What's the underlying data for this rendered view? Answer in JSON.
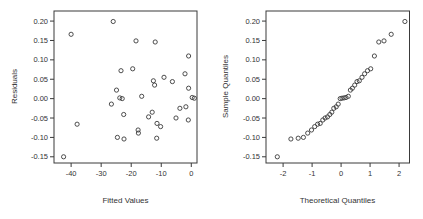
{
  "window": {
    "background": "#ffffff"
  },
  "style": {
    "axis_color": "#3a3a3a",
    "text_color": "#333333",
    "point_color": "#3a3a3a",
    "marker": "open-circle"
  },
  "chart_data": [
    {
      "id": "residuals-vs-fitted",
      "type": "scatter",
      "title": "",
      "xlabel": "Fitted Values",
      "ylabel": "Residuals",
      "xlim": [
        -45.7,
        1.9
      ],
      "ylim": [
        -0.166,
        0.226
      ],
      "grid": false,
      "legend": false,
      "xtick_values": [
        -40,
        -30,
        -20,
        -10,
        0
      ],
      "xtick_labels": [
        "-40",
        "-30",
        "-20",
        "-10",
        "0"
      ],
      "ytick_values": [
        0.2,
        0.15,
        0.1,
        0.05,
        0.0,
        -0.05,
        -0.1,
        -0.15
      ],
      "ytick_labels": [
        "0.20",
        "0.15",
        "0.10",
        "0.05",
        "0.00",
        "-0.05",
        "-0.10",
        "-0.15"
      ],
      "points": [
        [
          -42.5,
          -0.15
        ],
        [
          -40.0,
          0.166
        ],
        [
          -38.0,
          -0.066
        ],
        [
          -26.0,
          0.199
        ],
        [
          -26.6,
          -0.014
        ],
        [
          -24.9,
          0.022
        ],
        [
          -23.4,
          0.072
        ],
        [
          -23.8,
          0.002
        ],
        [
          -23.0,
          0.0
        ],
        [
          -22.5,
          -0.041
        ],
        [
          -24.6,
          -0.1
        ],
        [
          -22.4,
          -0.104
        ],
        [
          -19.5,
          0.077
        ],
        [
          -18.4,
          0.149
        ],
        [
          -17.7,
          -0.081
        ],
        [
          -17.6,
          -0.089
        ],
        [
          -16.5,
          0.006
        ],
        [
          -14.2,
          -0.047
        ],
        [
          -13.0,
          -0.035
        ],
        [
          -12.6,
          0.046
        ],
        [
          -12.2,
          0.035
        ],
        [
          -12.0,
          0.146
        ],
        [
          -11.4,
          -0.064
        ],
        [
          -11.5,
          -0.102
        ],
        [
          -10.2,
          -0.072
        ],
        [
          -9.1,
          0.055
        ],
        [
          -6.3,
          0.044
        ],
        [
          -5.1,
          -0.05
        ],
        [
          -3.8,
          -0.025
        ],
        [
          -2.1,
          0.064
        ],
        [
          -1.8,
          -0.021
        ],
        [
          -1.0,
          -0.055
        ],
        [
          -0.9,
          0.11
        ],
        [
          -0.9,
          0.027
        ],
        [
          0.3,
          0.003
        ],
        [
          1.0,
          0.001
        ]
      ]
    },
    {
      "id": "normal-qq",
      "type": "scatter",
      "title": "",
      "xlabel": "Theoretical Quantiles",
      "ylabel": "Sample Quantiles",
      "xlim": [
        -2.59,
        2.36
      ],
      "ylim": [
        -0.166,
        0.226
      ],
      "grid": false,
      "legend": false,
      "xtick_values": [
        -2,
        -1,
        0,
        1,
        2
      ],
      "xtick_labels": [
        "-2",
        "-1",
        "0",
        "1",
        "2"
      ],
      "ytick_values": [
        0.2,
        0.15,
        0.1,
        0.05,
        0.0,
        -0.05,
        -0.1,
        -0.15
      ],
      "ytick_labels": [
        "0.20",
        "0.15",
        "0.10",
        "0.05",
        "0.00",
        "-0.05",
        "-0.10",
        "-0.15"
      ],
      "points": [
        [
          -2.2,
          -0.15
        ],
        [
          -1.73,
          -0.104
        ],
        [
          -1.48,
          -0.102
        ],
        [
          -1.3,
          -0.1
        ],
        [
          -1.15,
          -0.089
        ],
        [
          -1.02,
          -0.081
        ],
        [
          -0.91,
          -0.072
        ],
        [
          -0.81,
          -0.066
        ],
        [
          -0.72,
          -0.064
        ],
        [
          -0.63,
          -0.055
        ],
        [
          -0.55,
          -0.05
        ],
        [
          -0.47,
          -0.047
        ],
        [
          -0.39,
          -0.041
        ],
        [
          -0.32,
          -0.035
        ],
        [
          -0.25,
          -0.025
        ],
        [
          -0.17,
          -0.021
        ],
        [
          -0.1,
          -0.014
        ],
        [
          -0.03,
          0.0
        ],
        [
          0.03,
          0.001
        ],
        [
          0.1,
          0.002
        ],
        [
          0.17,
          0.003
        ],
        [
          0.25,
          0.006
        ],
        [
          0.32,
          0.022
        ],
        [
          0.39,
          0.027
        ],
        [
          0.47,
          0.035
        ],
        [
          0.55,
          0.044
        ],
        [
          0.63,
          0.046
        ],
        [
          0.72,
          0.055
        ],
        [
          0.81,
          0.064
        ],
        [
          0.91,
          0.072
        ],
        [
          1.02,
          0.077
        ],
        [
          1.15,
          0.11
        ],
        [
          1.3,
          0.146
        ],
        [
          1.48,
          0.149
        ],
        [
          1.73,
          0.166
        ],
        [
          2.2,
          0.199
        ]
      ]
    }
  ]
}
